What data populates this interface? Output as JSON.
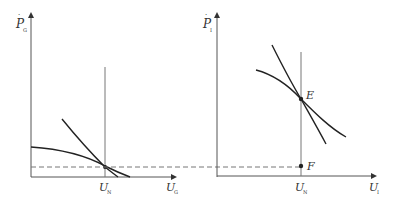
{
  "left_panel": {
    "y_axis_label": "P",
    "y_axis_sub": "G",
    "x_axis_label": "U",
    "x_axis_sub": "G",
    "vline_label": "U",
    "vline_sub": "N"
  },
  "right_panel": {
    "y_axis_label": "P",
    "y_axis_sub": "I",
    "x_axis_label": "U",
    "x_axis_sub": "I",
    "vline_label": "U",
    "vline_sub": "N",
    "point_e_label": "E",
    "point_f_label": "F"
  },
  "colors": {
    "axis": "#555555",
    "curve": "#222222",
    "dashed": "#777777"
  }
}
